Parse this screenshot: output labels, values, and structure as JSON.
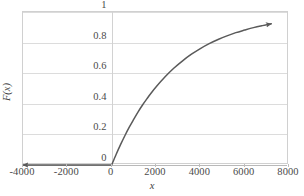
{
  "chart_data": {
    "type": "line",
    "title": "",
    "subtitle": "",
    "xlabel": "x",
    "ylabel": "F(x)",
    "xlim": [
      -4000,
      8000
    ],
    "ylim": [
      0,
      1
    ],
    "grid": true,
    "legend": false,
    "legend_position": "none",
    "x_ticks": [
      -4000,
      -2000,
      0,
      2000,
      4000,
      6000,
      8000
    ],
    "x_tick_labels": [
      "-4000",
      "-2000",
      "0",
      "2000",
      "4000",
      "6000",
      "8000"
    ],
    "y_ticks": [
      0,
      0.2,
      0.4,
      0.6,
      0.8,
      1
    ],
    "y_tick_labels": [
      "0",
      "0.2",
      "0.4",
      "0.6",
      "0.8",
      "1"
    ],
    "annotations": [
      "left arrowhead at x = -4000, y = 0",
      "right arrowhead at x = 7200, y = 0.92"
    ],
    "series": [
      {
        "name": "F(x)",
        "color": "#5a5a5a",
        "description": "Exponential cumulative distribution function, F(x) = 0 for x < 0 and F(x) = 1 - exp(-x/2800) for x >= 0",
        "x": [
          -4000,
          -3000,
          -2000,
          -1000,
          -500,
          0,
          200,
          400,
          600,
          800,
          1000,
          1200,
          1400,
          1600,
          1800,
          2000,
          2400,
          2800,
          3200,
          3600,
          4000,
          4400,
          4800,
          5200,
          5600,
          6000,
          6400,
          6800,
          7200
        ],
        "values": [
          0,
          0,
          0,
          0,
          0,
          0,
          0.069,
          0.133,
          0.193,
          0.249,
          0.3,
          0.349,
          0.394,
          0.435,
          0.474,
          0.51,
          0.575,
          0.632,
          0.681,
          0.724,
          0.761,
          0.793,
          0.82,
          0.844,
          0.865,
          0.882,
          0.898,
          0.911,
          0.923
        ]
      }
    ]
  },
  "labels": {
    "x_axis_title": "x",
    "y_axis_title": "F(x)"
  },
  "colors": {
    "curve": "#5a5a5a",
    "gridline": "#dcdcdc",
    "frame": "#d0d0d0",
    "baseline": "#b9b9b9",
    "text": "#4a4a4a",
    "background": "#ffffff"
  }
}
